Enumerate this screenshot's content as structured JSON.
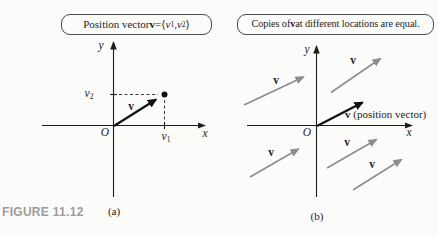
{
  "figure": {
    "caption": "FIGURE 11.12",
    "panel_a_tag": "(a)",
    "panel_b_tag": "(b)"
  },
  "panel_a": {
    "callout_parts": [
      "Position vector ",
      "v",
      " = ",
      "⟨",
      "v",
      "1",
      ", ",
      "v",
      "2",
      "⟩"
    ],
    "y_axis_label": "y",
    "x_axis_label": "x",
    "origin_label": "O",
    "vector_label": "v",
    "v1_tick": {
      "base": "v",
      "sub": "1"
    },
    "v2_tick": {
      "base": "v",
      "sub": "2"
    }
  },
  "panel_b": {
    "callout_parts": [
      "Copies of ",
      "v",
      " at different locations are equal."
    ],
    "y_axis_label": "y",
    "x_axis_label": "x",
    "origin_label": "O",
    "position_vector": {
      "bold": "v",
      "rest": " (position vector)"
    },
    "copy_labels": [
      "v",
      "v",
      "v",
      "v",
      "v"
    ]
  },
  "colors": {
    "ink": "#1d1d1d",
    "gray_arrow": "#8d8d8d",
    "caption_gray": "#9c9c9c",
    "paper": "#fbfbf9"
  }
}
